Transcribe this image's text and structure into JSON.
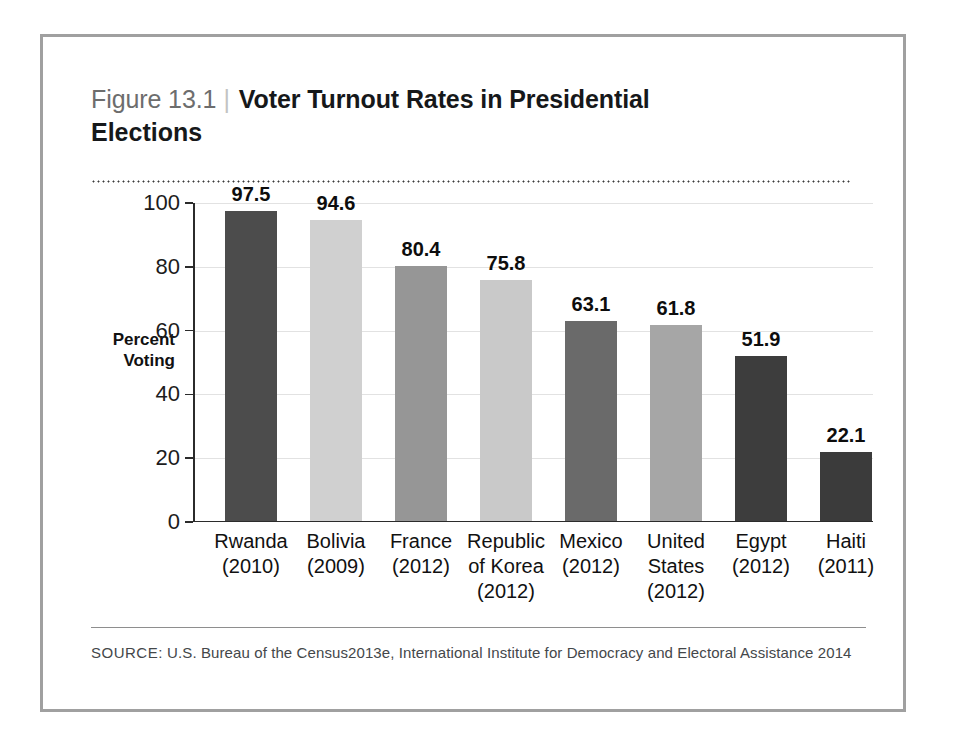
{
  "figure": {
    "number": "Figure 13.1",
    "divider": "|",
    "title_line_1": "Voter Turnout Rates in Presidential",
    "title_line_2": "Elections",
    "source_label": "SOURCE:",
    "source_text": " U.S. Bureau of the Census2013e, International Institute for Democracy and Electoral Assistance 2014"
  },
  "chart_data": {
    "type": "bar",
    "title": "Voter Turnout Rates in Presidential Elections",
    "xlabel": "",
    "ylabel": "Percent Voting",
    "ylabel_lines": [
      "Percent",
      "Voting"
    ],
    "ylim": [
      0,
      100
    ],
    "yticks": [
      0,
      20,
      40,
      60,
      80,
      100
    ],
    "ytick_labels": [
      "0",
      "20",
      "40",
      "60",
      "80",
      "100"
    ],
    "grid": true,
    "legend": false,
    "categories": [
      "Rwanda (2010)",
      "Bolivia (2009)",
      "France (2012)",
      "Republic of Korea (2012)",
      "Mexico (2012)",
      "United States (2012)",
      "Egypt (2012)",
      "Haiti (2011)"
    ],
    "category_labels": [
      {
        "name_lines": [
          "Rwanda"
        ],
        "year": "(2010)"
      },
      {
        "name_lines": [
          "Bolivia"
        ],
        "year": "(2009)"
      },
      {
        "name_lines": [
          "France"
        ],
        "year": "(2012)"
      },
      {
        "name_lines": [
          "Republic",
          "of Korea"
        ],
        "year": "(2012)"
      },
      {
        "name_lines": [
          "Mexico"
        ],
        "year": "(2012)"
      },
      {
        "name_lines": [
          "United",
          "States"
        ],
        "year": "(2012)"
      },
      {
        "name_lines": [
          "Egypt"
        ],
        "year": "(2012)"
      },
      {
        "name_lines": [
          "Haiti"
        ],
        "year": "(2011)"
      }
    ],
    "values": [
      97.5,
      94.6,
      80.4,
      75.8,
      63.1,
      61.8,
      51.9,
      22.1
    ],
    "value_labels": [
      "97.5",
      "94.6",
      "80.4",
      "75.8",
      "63.1",
      "61.8",
      "51.9",
      "22.1"
    ],
    "bar_colors": [
      "#4c4c4c",
      "#d0d0d0",
      "#969696",
      "#c9c9c9",
      "#6a6a6a",
      "#a6a6a6",
      "#3d3d3d",
      "#3b3b3b"
    ]
  },
  "colors": {
    "frame_border": "#a0a0a0",
    "axis": "#2b2b2b",
    "gridline": "#e2e2e2",
    "figure_number": "#6d6d6d",
    "title": "#16181a",
    "source": "#44474a"
  }
}
